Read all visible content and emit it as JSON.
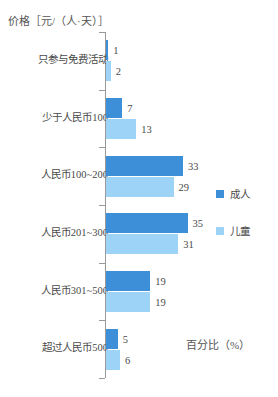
{
  "chart_data": {
    "type": "bar",
    "orientation": "horizontal",
    "title": "",
    "xlabel": "百分比（%）",
    "ylabel": "价格［元/（人·天）］",
    "categories": [
      "只参与免费活动",
      "少于人民币100",
      "人民币100~200",
      "人民币201~300",
      "人民币301~500",
      "超过人民币500"
    ],
    "series": [
      {
        "name": "成人",
        "color": "#3d8fd8",
        "values": [
          1,
          7,
          33,
          35,
          19,
          5
        ]
      },
      {
        "name": "儿童",
        "color": "#9dd3f7",
        "values": [
          2,
          13,
          29,
          31,
          19,
          6
        ]
      }
    ],
    "xlim": [
      0,
      40
    ],
    "grid": false,
    "legend_position": "right"
  },
  "axes": {
    "y_title": "价格［元/（人·天）］",
    "x_title": "百分比（%）"
  },
  "legend": {
    "items": [
      {
        "label": "成人",
        "color": "#3d8fd8"
      },
      {
        "label": "儿童",
        "color": "#9dd3f7"
      }
    ]
  },
  "groups": [
    {
      "label": "只参与免费活动",
      "adult_value": "1",
      "child_value": "2"
    },
    {
      "label": "少于人民币100",
      "adult_value": "7",
      "child_value": "13"
    },
    {
      "label": "人民币100~200",
      "adult_value": "33",
      "child_value": "29"
    },
    {
      "label": "人民币201~300",
      "adult_value": "35",
      "child_value": "31"
    },
    {
      "label": "人民币301~500",
      "adult_value": "19",
      "child_value": "19"
    },
    {
      "label": "超过人民币500",
      "adult_value": "5",
      "child_value": "6"
    }
  ]
}
